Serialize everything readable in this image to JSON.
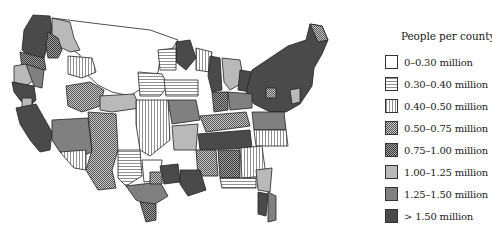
{
  "legend": {
    "title": "People per county",
    "items": [
      {
        "label": "0–0.30 million",
        "pattern": "blank",
        "fill": "#ffffff"
      },
      {
        "label": "0.30–0.40 million",
        "pattern": "horizontal-lines",
        "fill": "#ffffff"
      },
      {
        "label": "0.40–0.50 million",
        "pattern": "vertical-lines",
        "fill": "#ffffff"
      },
      {
        "label": "0.50–0.75 million",
        "pattern": "fine-crosshatch-light",
        "fill": "#9a9a9a"
      },
      {
        "label": "0.75–1.00 million",
        "pattern": "fine-crosshatch-dark",
        "fill": "#8a8a8a"
      },
      {
        "label": "1.00–1.25 million",
        "pattern": "solid",
        "fill": "#b9b9b9"
      },
      {
        "label": "1.25–1.50 million",
        "pattern": "solid",
        "fill": "#808080"
      },
      {
        "label": "> 1.50 million",
        "pattern": "solid",
        "fill": "#4a4a4a"
      }
    ]
  },
  "map": {
    "subject": "Contiguous United States divided into regions of roughly equal population",
    "outline_color": "#222222"
  }
}
